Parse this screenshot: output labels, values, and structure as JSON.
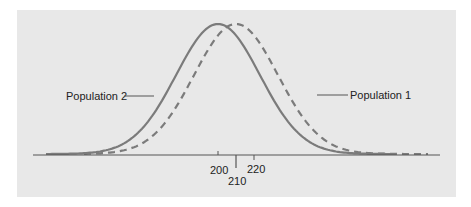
{
  "chart_data": {
    "type": "line",
    "title": "",
    "xlabel": "",
    "ylabel": "",
    "grid": false,
    "background": "#e8e8e8",
    "x_ticks": [
      {
        "label": "200",
        "value": 200
      },
      {
        "label": "210",
        "value": 210
      },
      {
        "label": "220",
        "value": 220
      }
    ],
    "series": [
      {
        "name": "Population 2",
        "style": "solid",
        "color": "#7a7a7a",
        "mean": 200,
        "label": "Population 2"
      },
      {
        "name": "Population 1",
        "style": "dashed",
        "color": "#7a7a7a",
        "mean": 210,
        "label": "Population 1"
      }
    ],
    "annotations": [
      {
        "text": "Population 2",
        "points_to": "solid curve, left side"
      },
      {
        "text": "Population 1",
        "points_to": "dashed curve, right side"
      }
    ]
  },
  "labels": {
    "pop2": "Population 2",
    "pop1": "Population 1",
    "tick200": "200",
    "tick210": "210",
    "tick220": "220"
  }
}
